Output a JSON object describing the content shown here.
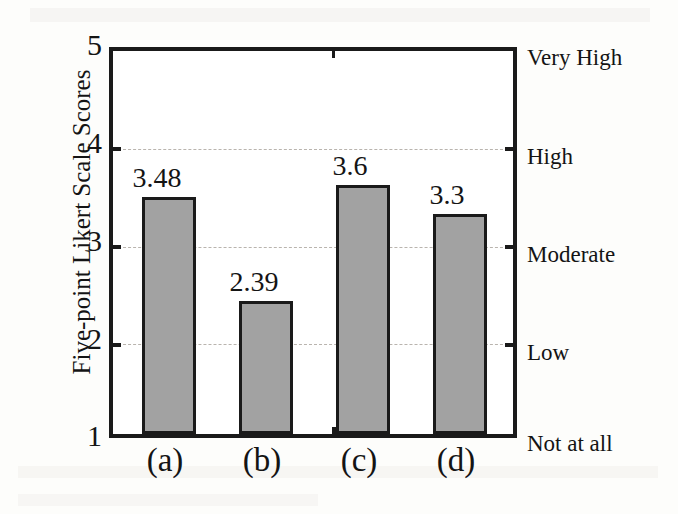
{
  "chart_data": {
    "type": "bar",
    "title": "",
    "subtitle": "",
    "xlabel": "",
    "ylabel": "Five-point Likert Scale Scores",
    "categories": [
      "(a)",
      "(b)",
      "(c)",
      "(d)"
    ],
    "values": [
      3.48,
      2.39,
      3.6,
      3.3
    ],
    "value_labels": [
      "3.48",
      "2.39",
      "3.6",
      "3.3"
    ],
    "series": [
      {
        "name": "Five-point Likert Scale Scores",
        "values": [
          3.48,
          2.39,
          3.6,
          3.3
        ]
      }
    ],
    "ylim": [
      1,
      5
    ],
    "yticks": [
      1,
      2,
      3,
      4,
      5
    ],
    "ytick_labels": [
      "1",
      "2",
      "3",
      "4",
      "5"
    ],
    "secondary_axis": {
      "position": "right",
      "ticks": [
        1,
        2,
        3,
        4,
        5
      ],
      "tick_labels": [
        "Not at all",
        "Low",
        "Moderate",
        "High",
        "Very High"
      ]
    },
    "grid": true,
    "grid_axis": "y",
    "grid_style": "dashed",
    "legend": false,
    "legend_position": "none",
    "bar_fill_color": "#a2a2a2",
    "bar_edge_color": "#1a1a1a",
    "axis_color": "#1a1a1a",
    "grid_color": "#b9b4ae",
    "background_color": "#ffffff",
    "annotations": []
  },
  "axis": {
    "y_title": "Five-point Likert Scale Scores",
    "y_ticks": [
      {
        "value": 5,
        "label": "5"
      },
      {
        "value": 4,
        "label": "4"
      },
      {
        "value": 3,
        "label": "3"
      },
      {
        "value": 2,
        "label": "2"
      },
      {
        "value": 1,
        "label": "1"
      }
    ],
    "scale_labels": [
      {
        "value": 5,
        "label": "Very High"
      },
      {
        "value": 4,
        "label": "High"
      },
      {
        "value": 3,
        "label": "Moderate"
      },
      {
        "value": 2,
        "label": "Low"
      },
      {
        "value": 1,
        "label": "Not at all"
      }
    ]
  },
  "bars": [
    {
      "category": "(a)",
      "value": 3.48,
      "value_label": "3.48"
    },
    {
      "category": "(b)",
      "value": 2.39,
      "value_label": "2.39"
    },
    {
      "category": "(c)",
      "value": 3.6,
      "value_label": "3.6"
    },
    {
      "category": "(d)",
      "value": 3.3,
      "value_label": "3.3"
    }
  ],
  "bleed_text": {
    "line_1": "3.6",
    "line_2": "2.39",
    "line_3": "(a)",
    "line_4": "(b)"
  }
}
